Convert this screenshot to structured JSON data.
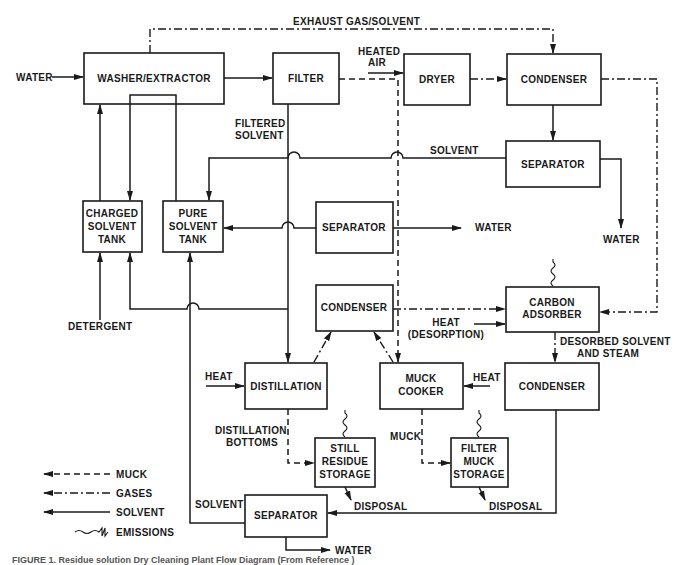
{
  "diagram": {
    "type": "process-flow",
    "title_caption": "FIGURE 1. Residue solution Dry Cleaning Plant Flow Diagram (From Reference )",
    "boxes": {
      "washer": "WASHER/EXTRACTOR",
      "filter": "FILTER",
      "dryer": "DRYER",
      "condenser_top": "CONDENSER",
      "separator_top": "SEPARATOR",
      "charged_tank": [
        "CHARGED",
        "SOLVENT",
        "TANK"
      ],
      "pure_tank": [
        "PURE",
        "SOLVENT",
        "TANK"
      ],
      "separator_mid": "SEPARATOR",
      "condenser_mid": "CONDENSER",
      "carbon_adsorber": [
        "CARBON",
        "ADSORBER"
      ],
      "distillation": "DISTILLATION",
      "muck_cooker": [
        "MUCK",
        "COOKER"
      ],
      "condenser_low": "CONDENSER",
      "still_residue": [
        "STILL",
        "RESIDUE",
        "STORAGE"
      ],
      "filter_muck": [
        "FILTER",
        "MUCK",
        "STORAGE"
      ],
      "separator_bottom": "SEPARATOR"
    },
    "labels": {
      "water_in": "WATER",
      "exhaust": "EXHAUST GAS/SOLVENT",
      "heated_air": [
        "HEATED",
        "AIR"
      ],
      "filtered_solvent": [
        "FILTERED",
        "SOLVENT"
      ],
      "solvent_top": "SOLVENT",
      "water_sep_mid": "WATER",
      "water_sep_top": "WATER",
      "detergent": "DETERGENT",
      "heat_desorption": [
        "HEAT",
        "(DESORPTION)"
      ],
      "desorbed": [
        "DESORBED SOLVENT",
        "AND STEAM"
      ],
      "heat_distillation": "HEAT",
      "heat_cooker": "HEAT",
      "distillation_bottoms": [
        "DISTILLATION",
        "BOTTOMS"
      ],
      "muck": "MUCK",
      "disposal_1": "DISPOSAL",
      "disposal_2": "DISPOSAL",
      "solvent_bottom": "SOLVENT",
      "water_bottom": "WATER"
    },
    "legend": [
      {
        "style": "dashed",
        "label": "MUCK"
      },
      {
        "style": "dash-dot",
        "label": "GASES"
      },
      {
        "style": "solid",
        "label": "SOLVENT"
      },
      {
        "style": "wavy",
        "label": "EMISSIONS"
      }
    ]
  }
}
